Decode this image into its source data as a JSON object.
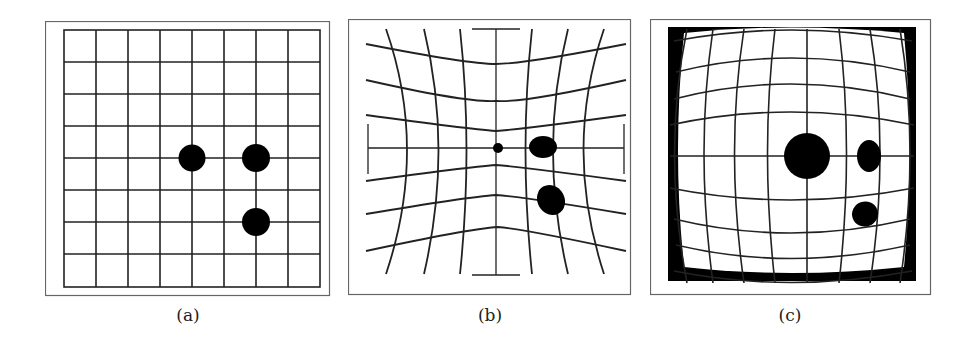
{
  "figure": {
    "panels": [
      {
        "id": "a",
        "caption": "(a)",
        "description": "Undistorted square grid with three dots"
      },
      {
        "id": "b",
        "caption": "(b)",
        "description": "Pincushion-distorted grid; dots shrink toward center"
      },
      {
        "id": "c",
        "caption": "(c)",
        "description": "Barrel-distorted grid; central dot magnified, black corners"
      }
    ],
    "colors": {
      "line": "#222222",
      "frame": "#555555",
      "background": "#ffffff",
      "fill": "#000000"
    }
  }
}
